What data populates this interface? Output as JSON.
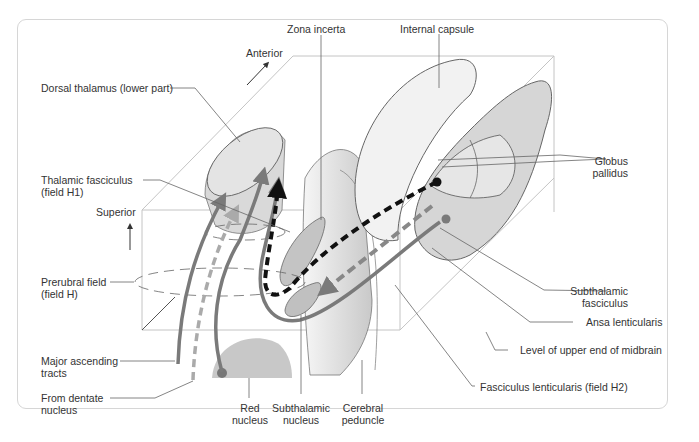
{
  "diagram": {
    "labels": {
      "zona_incerta": "Zona incerta",
      "internal_capsule": "Internal capsule",
      "anterior": "Anterior",
      "dorsal_thalamus": "Dorsal thalamus (lower part)",
      "globus_pallidus_1": "Globus",
      "globus_pallidus_2": "pallidus",
      "thalamic_fasciculus_1": "Thalamic fasciculus",
      "thalamic_fasciculus_2": "(field H1)",
      "superior": "Superior",
      "prerubral_1": "Prerubral field",
      "prerubral_2": "(field H)",
      "subthalamic_fasciculus_1": "Subthalamic",
      "subthalamic_fasciculus_2": "fasciculus",
      "ansa_lenticularis": "Ansa lenticularis",
      "level_midbrain": "Level of upper end of midbrain",
      "major_ascending_1": "Major ascending",
      "major_ascending_2": "tracts",
      "from_dentate_1": "From dentate",
      "from_dentate_2": "nucleus",
      "red_nucleus_1": "Red",
      "red_nucleus_2": "nucleus",
      "subthalamic_nucleus_1": "Subthalamic",
      "subthalamic_nucleus_2": "nucleus",
      "cerebral_peduncle_1": "Cerebral",
      "cerebral_peduncle_2": "peduncle",
      "fasciculus_lenticularis": "Fasciculus lenticularis (field H2)"
    },
    "colors": {
      "structure_fill": "#cfcfcf",
      "structure_light": "#efefef",
      "pathway_gray": "#7a7a7a",
      "pathway_light": "#b0b0b0",
      "pathway_black": "#111111",
      "leader_line": "#555555",
      "box_line": "#bdbdbd"
    }
  }
}
